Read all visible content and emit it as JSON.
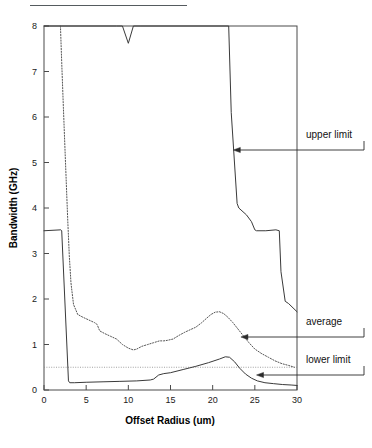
{
  "figure": {
    "top_rule_name": "header-rule"
  },
  "chart_data": {
    "type": "line",
    "title": "",
    "xlabel": "Offset  Radius (um)",
    "ylabel": "Bandwidth (GHz)",
    "xlim": [
      0,
      30
    ],
    "ylim": [
      0,
      8
    ],
    "xticks": [
      0,
      5,
      10,
      15,
      20,
      25,
      30
    ],
    "yticks": [
      0,
      1,
      2,
      3,
      4,
      5,
      6,
      7,
      8
    ],
    "xtick_labels": [
      "0",
      "5",
      "10",
      "15",
      "20",
      "25",
      "30"
    ],
    "ytick_labels": [
      "0",
      "1",
      "2",
      "3",
      "4",
      "5",
      "6",
      "7",
      "8"
    ],
    "grid": false,
    "legend_position": "right-annotations",
    "series": [
      {
        "name": "upper limit",
        "style": "solid",
        "color": "#3a3a3a",
        "x": [
          0.0,
          8.6,
          9.3,
          10.0,
          10.6,
          11.4,
          21.9,
          22.2,
          22.9,
          23.1,
          24.0,
          24.6,
          25.0,
          25.2,
          26.3,
          27.5,
          27.9,
          28.1,
          28.6,
          29.0,
          30.0
        ],
        "y": [
          8.0,
          8.0,
          8.0,
          7.62,
          8.0,
          8.0,
          8.0,
          6.1,
          4.1,
          4.0,
          3.85,
          3.7,
          3.52,
          3.5,
          3.5,
          3.52,
          3.5,
          2.6,
          1.95,
          1.9,
          1.72
        ]
      },
      {
        "name": "average",
        "style": "dotted",
        "color": "#555555",
        "x": [
          1.95,
          2.1,
          2.3,
          2.55,
          2.8,
          3.0,
          3.2,
          3.5,
          4.0,
          4.6,
          5.3,
          6.0,
          6.3,
          6.6,
          7.2,
          7.9,
          8.6,
          9.3,
          10.0,
          10.6,
          11.0,
          11.6,
          12.3,
          13.0,
          13.7,
          14.2,
          14.6,
          15.3,
          16.0,
          16.7,
          17.4,
          18.0,
          18.7,
          19.3,
          19.8,
          20.3,
          20.8,
          21.3,
          21.8,
          22.4,
          23.0,
          23.6,
          24.3,
          25.0,
          25.8,
          26.6,
          27.4,
          28.2,
          29.0,
          29.7
        ],
        "y": [
          8.0,
          7.2,
          6.2,
          5.0,
          3.8,
          2.95,
          2.35,
          1.88,
          1.66,
          1.6,
          1.54,
          1.48,
          1.44,
          1.3,
          1.24,
          1.18,
          1.12,
          1.0,
          0.92,
          0.88,
          0.9,
          0.96,
          1.0,
          1.04,
          1.08,
          1.08,
          1.09,
          1.12,
          1.2,
          1.27,
          1.33,
          1.38,
          1.48,
          1.58,
          1.66,
          1.71,
          1.72,
          1.68,
          1.6,
          1.48,
          1.34,
          1.2,
          1.04,
          0.9,
          0.8,
          0.72,
          0.64,
          0.58,
          0.54,
          0.5
        ]
      },
      {
        "name": "lower limit",
        "style": "solid",
        "color": "#3a3a3a",
        "x": [
          0.0,
          2.0,
          2.1,
          2.9,
          3.05,
          3.6,
          5.0,
          7.0,
          9.0,
          11.0,
          12.6,
          13.0,
          13.6,
          14.2,
          15.0,
          16.5,
          18.0,
          19.5,
          20.8,
          21.5,
          22.0,
          22.6,
          23.2,
          23.9,
          24.6,
          25.3,
          26.2,
          27.2,
          28.3,
          29.3,
          30.0
        ],
        "y": [
          3.5,
          3.52,
          3.5,
          0.2,
          0.16,
          0.16,
          0.17,
          0.18,
          0.19,
          0.2,
          0.22,
          0.24,
          0.33,
          0.36,
          0.38,
          0.45,
          0.52,
          0.6,
          0.68,
          0.73,
          0.72,
          0.62,
          0.48,
          0.35,
          0.26,
          0.2,
          0.16,
          0.14,
          0.12,
          0.11,
          0.1
        ]
      }
    ],
    "threshold": {
      "name": "lower-limit-threshold",
      "value": 0.5,
      "style": "dotted",
      "x_from": 0,
      "x_to": 30
    },
    "annotations": [
      {
        "id": "upper-limit",
        "label": "upper limit",
        "target_x": 22.45,
        "target_y": 5.28,
        "label_x": 306,
        "label_y": 138
      },
      {
        "id": "average",
        "label": "average",
        "target_x": 23.35,
        "target_y": 1.27,
        "label_x": 306,
        "label_y": 325
      },
      {
        "id": "lower-limit",
        "label": "lower limit",
        "target_x": 25.2,
        "target_y": 0.43,
        "label_x": 306,
        "label_y": 363
      }
    ]
  }
}
